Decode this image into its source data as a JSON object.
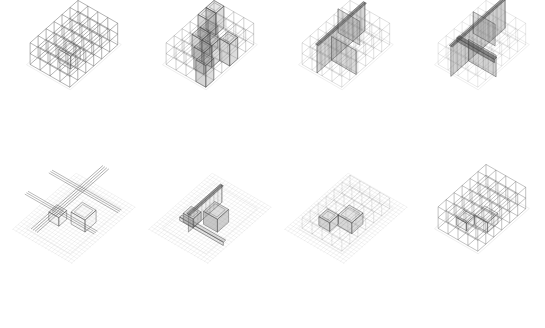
{
  "figure": {
    "title": "",
    "background": "#ffffff",
    "colors": {
      "line": "#555555",
      "light_line": "#bbbbbb",
      "faint_line": "#dddddd",
      "fill": "#8a8a8a",
      "dark": "#444444"
    },
    "layout": {
      "columns": 4,
      "rows": 2
    }
  },
  "panels": [
    {
      "id": "a1",
      "row": 0,
      "col": 0,
      "x": 0,
      "y": 0,
      "grid": {
        "nx": 4,
        "ny": 6,
        "nz": 2,
        "opacity": 0.75
      },
      "planes": [],
      "volumes": [
        {
          "gx": 1.6,
          "gy": 3.2,
          "w": 1.2,
          "d": 1.2,
          "h": 1.2,
          "op": 0.08
        }
      ],
      "hatch": false
    },
    {
      "id": "a2",
      "row": 0,
      "col": 1,
      "x": 136,
      "y": 0,
      "grid": {
        "nx": 4,
        "ny": 6,
        "nz": 2,
        "opacity": 0.45
      },
      "planes": [
        {
          "type": "cells",
          "cells": [
            [
              0,
              1
            ],
            [
              1,
              2
            ],
            [
              1,
              3
            ],
            [
              2,
              3
            ],
            [
              2,
              4
            ],
            [
              3,
              5
            ],
            [
              0,
              0
            ],
            [
              3,
              2
            ]
          ],
          "op": 0.3
        }
      ],
      "volumes": [],
      "hatch": false
    },
    {
      "id": "a3",
      "row": 0,
      "col": 2,
      "x": 272,
      "y": 0,
      "grid": {
        "nx": 4,
        "ny": 6,
        "nz": 2,
        "opacity": 0.3
      },
      "planes": [
        {
          "type": "wall-y",
          "at": 1.5,
          "from": 0,
          "to": 6,
          "h": 2.6,
          "op": 0.35
        },
        {
          "type": "wall-x",
          "at": 1.5,
          "from": 0,
          "to": 2.2,
          "h": 2.2,
          "op": 0.28
        },
        {
          "type": "wall-x",
          "at": 4.2,
          "from": 1.5,
          "to": 4,
          "h": 2.2,
          "op": 0.32
        }
      ],
      "volumes": [],
      "hatch": false
    },
    {
      "id": "a4",
      "row": 0,
      "col": 3,
      "x": 408,
      "y": 0,
      "grid": {
        "nx": 4,
        "ny": 6,
        "nz": 2,
        "opacity": 0.22
      },
      "planes": [
        {
          "type": "wall-y",
          "at": 1.6,
          "from": -0.4,
          "to": 6.4,
          "h": 2.8,
          "op": 0.4
        },
        {
          "type": "wall-x",
          "at": 1.6,
          "from": 0,
          "to": 2.2,
          "h": 2.0,
          "op": 0.3
        },
        {
          "type": "wall-x",
          "at": 4.2,
          "from": 1.6,
          "to": 4.4,
          "h": 2.0,
          "op": 0.36
        },
        {
          "type": "beam-x",
          "at": 4.5,
          "from": 0.8,
          "to": 4.6,
          "z": 2.0,
          "op": 0.55
        }
      ],
      "volumes": [],
      "hatch": false
    },
    {
      "id": "b1",
      "row": 1,
      "col": 0,
      "x": 0,
      "y": 164,
      "grid": {
        "nx": 4,
        "ny": 6,
        "nz": 0,
        "opacity": 0.0
      },
      "planes": [
        {
          "type": "bundle-y",
          "at": [
            1.3,
            1.5,
            1.7,
            1.9
          ],
          "from": -1.5,
          "to": 7.5,
          "z": 1.6,
          "op": 0.6
        },
        {
          "type": "bundle-x",
          "at": [
            1.4,
            1.6,
            1.8
          ],
          "from": -1.5,
          "to": 5.5,
          "z": 1.6,
          "op": 0.55
        },
        {
          "type": "bundle-x",
          "at": [
            4.4,
            4.6,
            4.8
          ],
          "from": -1.5,
          "to": 5.5,
          "z": 1.6,
          "op": 0.55
        }
      ],
      "volumes": [
        {
          "gx": 2.2,
          "gy": 2.2,
          "w": 1.4,
          "d": 1.4,
          "h": 1.1,
          "op": 0.06
        },
        {
          "gx": 0.6,
          "gy": 3.4,
          "w": 1.0,
          "d": 1.0,
          "h": 0.8,
          "op": 0.06
        }
      ],
      "hatch": true
    },
    {
      "id": "b2",
      "row": 1,
      "col": 1,
      "x": 136,
      "y": 164,
      "grid": {
        "nx": 4,
        "ny": 6,
        "nz": 0,
        "opacity": 0.0
      },
      "planes": [
        {
          "type": "wall-y",
          "at": 1.6,
          "from": 1.0,
          "to": 5.2,
          "h": 1.6,
          "op": 0.12
        },
        {
          "type": "beam-x",
          "at": 4.4,
          "from": 0.2,
          "to": 4.6,
          "z": 0.2,
          "op": 0.18
        }
      ],
      "volumes": [
        {
          "gx": 2.0,
          "gy": 2.4,
          "w": 1.4,
          "d": 1.4,
          "h": 1.2,
          "op": 0.4
        },
        {
          "gx": 0.6,
          "gy": 3.6,
          "w": 1.0,
          "d": 1.0,
          "h": 0.8,
          "op": 0.4
        }
      ],
      "hatch": true
    },
    {
      "id": "b3",
      "row": 1,
      "col": 2,
      "x": 272,
      "y": 164,
      "grid": {
        "nx": 4,
        "ny": 6,
        "nz": 1,
        "opacity": 0.25
      },
      "planes": [],
      "volumes": [
        {
          "gx": 2.0,
          "gy": 2.6,
          "w": 1.4,
          "d": 1.4,
          "h": 1.0,
          "op": 0.28
        },
        {
          "gx": 0.8,
          "gy": 3.8,
          "w": 1.1,
          "d": 1.1,
          "h": 0.8,
          "op": 0.3
        }
      ],
      "hatch": true
    },
    {
      "id": "b4",
      "row": 1,
      "col": 3,
      "x": 408,
      "y": 164,
      "grid": {
        "nx": 4,
        "ny": 6,
        "nz": 2,
        "opacity": 0.6
      },
      "planes": [],
      "volumes": [
        {
          "gx": 2.0,
          "gy": 2.6,
          "w": 1.3,
          "d": 1.3,
          "h": 0.9,
          "op": 0.1
        },
        {
          "gx": 0.9,
          "gy": 3.8,
          "w": 1.0,
          "d": 1.0,
          "h": 0.7,
          "op": 0.1
        }
      ],
      "hatch": false
    }
  ]
}
